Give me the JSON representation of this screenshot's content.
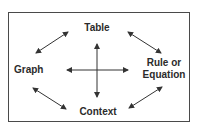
{
  "diagram": {
    "title": "",
    "nodes": {
      "table": "Table",
      "graph": "Graph",
      "rule_line1": "Rule or",
      "rule_line2": "Equation",
      "context": "Context"
    },
    "edges": [
      {
        "from": "Table",
        "to": "Graph",
        "type": "double-arrow"
      },
      {
        "from": "Table",
        "to": "Rule or Equation",
        "type": "double-arrow"
      },
      {
        "from": "Graph",
        "to": "Context",
        "type": "double-arrow"
      },
      {
        "from": "Rule or Equation",
        "to": "Context",
        "type": "double-arrow"
      },
      {
        "from": "Table",
        "to": "Context",
        "type": "double-arrow"
      },
      {
        "from": "Graph",
        "to": "Rule or Equation",
        "type": "double-arrow"
      }
    ],
    "colors": {
      "border": "#4a4a4a",
      "text": "#2b2b2b",
      "arrow": "#333333",
      "background": "#ffffff"
    }
  }
}
